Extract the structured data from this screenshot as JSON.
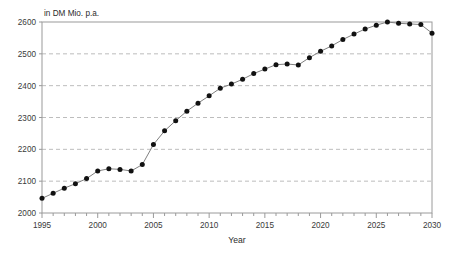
{
  "chart_data": {
    "type": "line",
    "title": "",
    "subtitle": "",
    "unit_label": "in DM Mio. p.a.",
    "xlabel": "Year",
    "ylabel": "",
    "xlim": [
      1995,
      2030
    ],
    "ylim": [
      2000,
      2600
    ],
    "xticks": [
      1995,
      2000,
      2005,
      2010,
      2015,
      2020,
      2025,
      2030
    ],
    "xtick_labels": [
      "1995",
      "2000",
      "2005",
      "2010",
      "2015",
      "2020",
      "2025",
      "2030"
    ],
    "x_minor_tick_step": 1,
    "yticks": [
      2000,
      2100,
      2200,
      2300,
      2400,
      2500,
      2600
    ],
    "ytick_labels": [
      "2000",
      "2100",
      "2200",
      "2300",
      "2400",
      "2500",
      "2600"
    ],
    "grid": "horizontal-dashed",
    "legend": "none",
    "marker": "filled-circle",
    "marker_color": "#111111",
    "line_color": "#808080",
    "x": [
      1995,
      1996,
      1997,
      1998,
      1999,
      2000,
      2001,
      2002,
      2003,
      2004,
      2005,
      2006,
      2007,
      2008,
      2009,
      2010,
      2011,
      2012,
      2013,
      2014,
      2015,
      2016,
      2017,
      2018,
      2019,
      2020,
      2021,
      2022,
      2023,
      2024,
      2025,
      2026,
      2027,
      2028,
      2029,
      2030
    ],
    "values": [
      2046,
      2062,
      2078,
      2092,
      2108,
      2132,
      2139,
      2137,
      2132,
      2152,
      2215,
      2258,
      2290,
      2320,
      2345,
      2368,
      2392,
      2405,
      2420,
      2438,
      2452,
      2466,
      2468,
      2465,
      2488,
      2508,
      2525,
      2545,
      2562,
      2578,
      2590,
      2600,
      2596,
      2594,
      2592,
      2565
    ],
    "series": [
      {
        "name": "value",
        "values": [
          2046,
          2062,
          2078,
          2092,
          2108,
          2132,
          2139,
          2137,
          2132,
          2152,
          2215,
          2258,
          2290,
          2320,
          2345,
          2368,
          2392,
          2405,
          2420,
          2438,
          2452,
          2466,
          2468,
          2465,
          2488,
          2508,
          2525,
          2545,
          2562,
          2578,
          2590,
          2600,
          2596,
          2594,
          2592,
          2565
        ]
      }
    ]
  },
  "colors": {
    "frame": "#9a9a9a",
    "grid": "#bdbdbd",
    "marker": "#111111",
    "line": "#8a8a8a",
    "text": "#2b2b2b",
    "background": "#ffffff"
  }
}
